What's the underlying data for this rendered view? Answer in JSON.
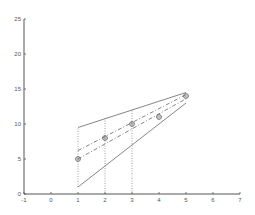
{
  "chart_data": {
    "type": "line",
    "title": "",
    "xlabel": "",
    "ylabel": "",
    "xlim": [
      -1,
      7
    ],
    "ylim": [
      0,
      25
    ],
    "grid": false,
    "legend": null,
    "xticks": [
      "-1",
      "0",
      "1",
      "2",
      "3",
      "4",
      "5",
      "6",
      "7"
    ],
    "yticks": [
      "0",
      "5",
      "10",
      "15",
      "20",
      "25"
    ],
    "series": [
      {
        "name": "data points",
        "style": "circle-markers",
        "x": [
          1,
          2,
          3,
          4,
          5
        ],
        "y": [
          5,
          8,
          10,
          11,
          14
        ]
      },
      {
        "name": "upper bound",
        "style": "solid",
        "x": [
          1,
          5
        ],
        "y": [
          9.5,
          14.5
        ]
      },
      {
        "name": "lower bound",
        "style": "solid",
        "x": [
          1,
          5
        ],
        "y": [
          1,
          13
        ]
      },
      {
        "name": "upper dashed fit",
        "style": "dashed",
        "x": [
          1,
          5
        ],
        "y": [
          6.2,
          14.2
        ]
      },
      {
        "name": "lower dashed fit",
        "style": "dashed",
        "x": [
          1,
          5
        ],
        "y": [
          5,
          13.6
        ]
      },
      {
        "name": "vertical guides",
        "style": "dotted",
        "x": [
          1,
          2,
          3
        ],
        "y_from": [
          1,
          0,
          0
        ],
        "y_to": [
          9.5,
          10.8,
          12
        ]
      }
    ],
    "colors": {
      "axis": "#555555",
      "lines": "#777777",
      "markers": "#666666"
    }
  }
}
